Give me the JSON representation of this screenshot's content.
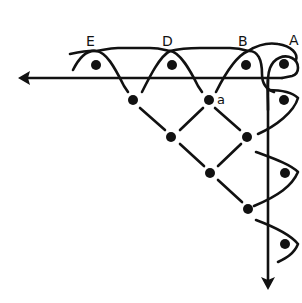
{
  "diagram": {
    "type": "stitch-lattice-diagram",
    "labels": {
      "E": "E",
      "D": "D",
      "B": "B",
      "A": "A",
      "a": "a"
    },
    "colors": {
      "ink": "#111111",
      "background": "#ffffff"
    },
    "arrows": [
      {
        "name": "horizontal-arrow",
        "direction": "left"
      },
      {
        "name": "vertical-arrow",
        "direction": "down"
      }
    ],
    "top_row_dots": [
      "E",
      "D",
      "B",
      "A"
    ],
    "right_column_dots": 3,
    "lattice_dot_count": 7
  }
}
